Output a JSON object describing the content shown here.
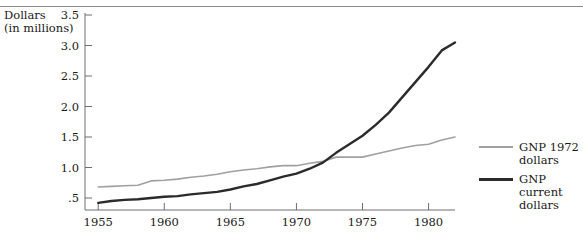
{
  "figure": {
    "y_axis_caption_line1": "Dollars",
    "y_axis_caption_line2": "(in millions)"
  },
  "legend": {
    "items": [
      {
        "label": "GNP 1972\ndollars",
        "color": "#a0a0a0",
        "swatch_name": "legend-line-gnp-1972"
      },
      {
        "label": "GNP\ncurrent\ndollars",
        "color": "#2b2b2b",
        "swatch_name": "legend-line-gnp-current"
      }
    ]
  },
  "chart_data": {
    "type": "line",
    "title": "",
    "xlabel": "",
    "ylabel": "Dollars (in millions)",
    "xlim": [
      1954,
      1982
    ],
    "ylim": [
      0.25,
      3.5
    ],
    "xticks": [
      1955,
      1960,
      1965,
      1970,
      1975,
      1980
    ],
    "xtick_labels": [
      "1955",
      "1960",
      "1965",
      "1970",
      "1975",
      "1980"
    ],
    "yticks": [
      0.5,
      1.0,
      1.5,
      2.0,
      2.5,
      3.0,
      3.5
    ],
    "ytick_labels": [
      ".5",
      "1.0",
      "1.5",
      "2.0",
      "2.5",
      "3.0",
      "3.5"
    ],
    "grid": false,
    "legend_position": "right",
    "x": [
      1955,
      1956,
      1957,
      1958,
      1959,
      1960,
      1961,
      1962,
      1963,
      1964,
      1965,
      1966,
      1967,
      1968,
      1969,
      1970,
      1971,
      1972,
      1973,
      1974,
      1975,
      1976,
      1977,
      1978,
      1979,
      1980,
      1981,
      1982
    ],
    "series": [
      {
        "name": "GNP 1972 dollars",
        "color": "#a0a0a0",
        "values": [
          0.68,
          0.69,
          0.7,
          0.71,
          0.78,
          0.79,
          0.81,
          0.84,
          0.86,
          0.89,
          0.93,
          0.96,
          0.98,
          1.01,
          1.03,
          1.03,
          1.07,
          1.1,
          1.17,
          1.17,
          1.17,
          1.22,
          1.27,
          1.32,
          1.36,
          1.38,
          1.45,
          1.5
        ]
      },
      {
        "name": "GNP current dollars",
        "color": "#2b2b2b",
        "values": [
          0.42,
          0.45,
          0.47,
          0.48,
          0.5,
          0.52,
          0.53,
          0.56,
          0.58,
          0.6,
          0.64,
          0.69,
          0.73,
          0.79,
          0.85,
          0.9,
          0.98,
          1.08,
          1.24,
          1.38,
          1.52,
          1.7,
          1.9,
          2.15,
          2.4,
          2.65,
          2.92,
          3.05
        ]
      }
    ]
  }
}
